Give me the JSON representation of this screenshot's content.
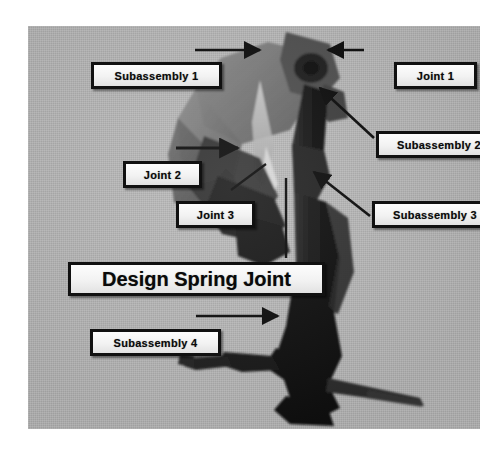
{
  "figure": {
    "title": "Design Spring Joint",
    "panel_background_color": "#b8b8b8",
    "label_box_fill_color": "#f2f2f2",
    "label_box_border_color": "#111111",
    "arrow_color": "#0a0a0a"
  },
  "callouts": [
    {
      "id": "subassembly-1",
      "label": "Subassembly 1",
      "size": "small"
    },
    {
      "id": "joint-1",
      "label": "Joint 1",
      "size": "small"
    },
    {
      "id": "subassembly-2",
      "label": "Subassembly 2",
      "size": "small"
    },
    {
      "id": "joint-2",
      "label": "Joint 2",
      "size": "small"
    },
    {
      "id": "joint-3",
      "label": "Joint 3",
      "size": "small"
    },
    {
      "id": "subassembly-3",
      "label": "Subassembly 3",
      "size": "small"
    },
    {
      "id": "design-spring-joint",
      "label": "Design Spring Joint",
      "size": "big"
    },
    {
      "id": "subassembly-4",
      "label": "Subassembly 4",
      "size": "small"
    }
  ],
  "labels": {
    "subassembly_1": "Subassembly 1",
    "joint_1": "Joint 1",
    "subassembly_2": "Subassembly 2",
    "joint_2": "Joint 2",
    "joint_3": "Joint 3",
    "subassembly_3": "Subassembly 3",
    "design_spring_joint": "Design Spring Joint",
    "subassembly_4": "Subassembly 4"
  },
  "leaders": [
    {
      "name": "leader-subassembly-1",
      "from": "Subassembly 1",
      "style": "horizontal-arrow-right"
    },
    {
      "name": "leader-joint-1",
      "from": "Joint 1",
      "style": "horizontal-arrow-left"
    },
    {
      "name": "leader-subassembly-2",
      "from": "Subassembly 2",
      "style": "diagonal-arrow-up-left"
    },
    {
      "name": "leader-joint-2",
      "from": "Joint 2",
      "style": "horizontal-arrow-right"
    },
    {
      "name": "leader-joint-3",
      "from": "Joint 3",
      "style": "diagonal-line-up-right"
    },
    {
      "name": "leader-subassembly-3",
      "from": "Subassembly 3",
      "style": "diagonal-arrow-up-left"
    },
    {
      "name": "leader-design-spring-joint",
      "from": "Design Spring Joint",
      "style": "vertical-line-up"
    },
    {
      "name": "leader-subassembly-4",
      "from": "Subassembly 4",
      "style": "horizontal-arrow-right"
    }
  ],
  "subject": {
    "description": "Photograph of a multi-segment robotic leg / arm assembly",
    "parts": [
      "Subassembly 1",
      "Subassembly 2",
      "Subassembly 3",
      "Subassembly 4"
    ],
    "joints": [
      "Joint 1",
      "Joint 2",
      "Joint 3",
      "Design Spring Joint"
    ]
  }
}
